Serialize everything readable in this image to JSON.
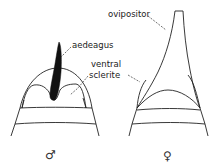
{
  "figure": {
    "type": "anatomical line drawing"
  },
  "panels": [
    {
      "id": "male",
      "sex_symbol": "♂",
      "labels": [
        {
          "text": "aedeagus"
        },
        {
          "text": "ventral"
        },
        {
          "text": "sclerite"
        }
      ]
    },
    {
      "id": "female",
      "sex_symbol": "♀",
      "labels": [
        {
          "text": "ovipositor"
        }
      ]
    }
  ],
  "colors": {
    "ink": "#222222",
    "background": "#ffffff"
  }
}
